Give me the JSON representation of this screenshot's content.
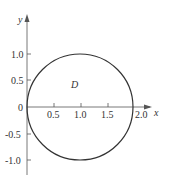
{
  "diagram": {
    "type": "circle-region",
    "axes": {
      "x_label": "x",
      "y_label": "y",
      "origin_label": "0",
      "x_ticks": [
        "0.5",
        "1.0",
        "1.5",
        "2.0"
      ],
      "y_ticks": [
        "1.0",
        "0.5",
        "-0.5",
        "-1.0"
      ]
    },
    "region_label": "D",
    "circle": {
      "center": [
        1,
        0
      ],
      "radius": 1
    },
    "colors": {
      "stroke": "#333333",
      "axis": "#555555"
    }
  }
}
